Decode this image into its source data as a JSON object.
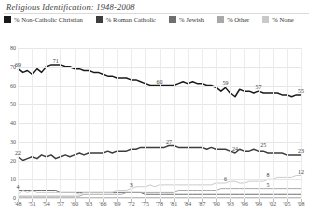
{
  "title": "Religious Identification: 1948-2008",
  "legend": {
    "position": "top",
    "items": [
      {
        "label": "% Non-Catholic Christian",
        "color": "#1a1a1a"
      },
      {
        "label": "% Roman Catholic",
        "color": "#3d3d3d"
      },
      {
        "label": "% Jewish",
        "color": "#6e6e6e"
      },
      {
        "label": "% Other",
        "color": "#a8a8a8"
      },
      {
        "label": "% None",
        "color": "#c9c9c9"
      }
    ]
  },
  "chart_data": {
    "type": "line",
    "title": "Religious Identification: 1948-2008",
    "xlabel": "",
    "ylabel": "",
    "ylim": [
      0,
      80
    ],
    "ystep": 10,
    "grid": true,
    "legend_position": "top",
    "ytick_labels": [
      "0",
      "10",
      "20",
      "30",
      "40",
      "50",
      "60",
      "70",
      "80"
    ],
    "x": [
      1948,
      1949,
      1950,
      1951,
      1952,
      1953,
      1954,
      1955,
      1956,
      1957,
      1958,
      1959,
      1960,
      1961,
      1962,
      1963,
      1964,
      1965,
      1966,
      1967,
      1968,
      1969,
      1970,
      1971,
      1972,
      1973,
      1974,
      1975,
      1976,
      1977,
      1978,
      1979,
      1980,
      1981,
      1982,
      1983,
      1984,
      1985,
      1986,
      1987,
      1988,
      1989,
      1990,
      1991,
      1992,
      1993,
      1994,
      1995,
      1996,
      1997,
      1998,
      1999,
      2000,
      2001,
      2002,
      2003,
      2004,
      2005,
      2006,
      2007,
      2008
    ],
    "xtick_labels": [
      "'48",
      "'51",
      "'54",
      "'57",
      "'60",
      "'63",
      "'66",
      "'69",
      "'72",
      "'75",
      "'78",
      "'81",
      "'84",
      "'87",
      "'90",
      "'93",
      "'96",
      "'99",
      "'02",
      "'05",
      "'08"
    ],
    "xtick_values": [
      1948,
      1951,
      1954,
      1957,
      1960,
      1963,
      1966,
      1969,
      1972,
      1975,
      1978,
      1981,
      1984,
      1987,
      1990,
      1993,
      1996,
      1999,
      2002,
      2005,
      2008
    ],
    "series": [
      {
        "name": "% Non-Catholic Christian",
        "color": "#1a1a1a",
        "values": [
          69,
          67,
          68,
          66,
          69,
          67,
          70,
          71,
          71,
          71,
          70,
          70,
          69,
          69,
          68,
          68,
          67,
          67,
          66,
          65,
          65,
          64,
          64,
          64,
          63,
          63,
          62,
          61,
          60,
          60,
          60,
          60,
          60,
          60,
          61,
          62,
          61,
          62,
          61,
          61,
          60,
          60,
          59,
          57,
          59,
          56,
          54,
          58,
          57,
          57,
          56,
          57,
          56,
          56,
          56,
          56,
          55,
          55,
          54,
          55,
          55
        ]
      },
      {
        "name": "% Roman Catholic",
        "color": "#3d3d3d",
        "values": [
          22,
          20,
          21,
          22,
          21,
          23,
          22,
          23,
          21,
          22,
          23,
          22,
          23,
          24,
          23,
          24,
          24,
          24,
          24,
          25,
          24,
          25,
          25,
          25,
          26,
          26,
          27,
          27,
          27,
          27,
          27,
          27,
          28,
          28,
          27,
          27,
          27,
          27,
          27,
          27,
          26,
          27,
          26,
          26,
          26,
          25,
          24,
          26,
          25,
          25,
          26,
          25,
          25,
          24,
          24,
          24,
          24,
          23,
          23,
          23,
          23
        ]
      },
      {
        "name": "% Jewish",
        "color": "#6e6e6e",
        "values": [
          4,
          4,
          4,
          4,
          4,
          4,
          4,
          4,
          4,
          3,
          3,
          3,
          3,
          3,
          3,
          3,
          3,
          3,
          3,
          3,
          3,
          3,
          3,
          3,
          3,
          3,
          3,
          2,
          2,
          2,
          2,
          2,
          2,
          2,
          2,
          2,
          2,
          2,
          2,
          2,
          2,
          2,
          2,
          2,
          2,
          2,
          2,
          2,
          2,
          2,
          2,
          2,
          2,
          2,
          2,
          2,
          2,
          2,
          2,
          2,
          2
        ]
      },
      {
        "name": "% Other",
        "color": "#a8a8a8",
        "values": [
          1,
          1,
          1,
          1,
          1,
          1,
          1,
          1,
          1,
          1,
          1,
          1,
          1,
          1,
          2,
          2,
          2,
          2,
          2,
          2,
          2,
          2,
          2,
          3,
          3,
          3,
          3,
          3,
          3,
          3,
          3,
          3,
          3,
          3,
          4,
          4,
          4,
          4,
          4,
          4,
          4,
          4,
          4,
          5,
          5,
          5,
          5,
          5,
          5,
          5,
          5,
          5,
          5,
          5,
          5,
          5,
          5,
          5,
          5,
          5,
          5
        ]
      },
      {
        "name": "% None",
        "color": "#c9c9c9",
        "values": [
          2,
          4,
          3,
          4,
          3,
          3,
          3,
          3,
          3,
          3,
          3,
          3,
          3,
          2,
          3,
          3,
          3,
          3,
          3,
          3,
          3,
          4,
          4,
          4,
          5,
          6,
          6,
          6,
          7,
          6,
          7,
          7,
          7,
          7,
          7,
          7,
          7,
          7,
          7,
          7,
          7,
          7,
          8,
          8,
          8,
          9,
          9,
          8,
          8,
          9,
          9,
          9,
          9,
          10,
          10,
          11,
          11,
          11,
          11,
          12,
          12
        ]
      }
    ],
    "annotations": [
      {
        "text": "69",
        "x": 1948,
        "y": 69,
        "series": "% Non-Catholic Christian"
      },
      {
        "text": "71",
        "x": 1956,
        "y": 71,
        "series": "% Non-Catholic Christian"
      },
      {
        "text": "60",
        "x": 1978,
        "y": 60,
        "series": "% Non-Catholic Christian"
      },
      {
        "text": "59",
        "x": 1992,
        "y": 59,
        "series": "% Non-Catholic Christian"
      },
      {
        "text": "57",
        "x": 1999,
        "y": 57,
        "series": "% Non-Catholic Christian"
      },
      {
        "text": "55",
        "x": 2008,
        "y": 55,
        "series": "% Non-Catholic Christian"
      },
      {
        "text": "22",
        "x": 1948,
        "y": 22,
        "series": "% Roman Catholic"
      },
      {
        "text": "27",
        "x": 1980,
        "y": 28,
        "series": "% Roman Catholic"
      },
      {
        "text": "24",
        "x": 1994,
        "y": 24,
        "series": "% Roman Catholic"
      },
      {
        "text": "25",
        "x": 2000,
        "y": 26,
        "series": "% Roman Catholic"
      },
      {
        "text": "23",
        "x": 2008,
        "y": 23,
        "series": "% Roman Catholic"
      },
      {
        "text": "4",
        "x": 1948,
        "y": 4,
        "series": "% Jewish"
      },
      {
        "text": "3",
        "x": 1972,
        "y": 5,
        "series": "% None"
      },
      {
        "text": "6",
        "x": 1992,
        "y": 8,
        "series": "% None"
      },
      {
        "text": "8",
        "x": 2001,
        "y": 10,
        "series": "% None"
      },
      {
        "text": "5",
        "x": 2001,
        "y": 5,
        "series": "% Other"
      },
      {
        "text": "12",
        "x": 2008,
        "y": 12,
        "series": "% None"
      }
    ]
  }
}
